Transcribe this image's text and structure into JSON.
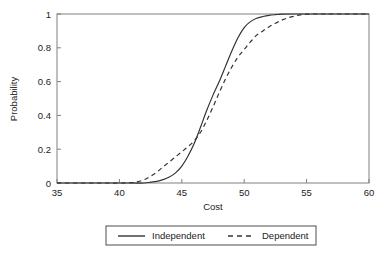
{
  "chart_data": {
    "type": "line",
    "title": "",
    "xlabel": "Cost",
    "ylabel": "Probability",
    "xlim": [
      35,
      60
    ],
    "ylim": [
      0,
      1
    ],
    "xticks": [
      35,
      40,
      45,
      50,
      55,
      60
    ],
    "xtick_labels": [
      "35",
      "40",
      "45",
      "50",
      "55",
      "60"
    ],
    "yticks": [
      0,
      0.2,
      0.4,
      0.6,
      0.8,
      1
    ],
    "ytick_labels": [
      "0",
      "0.2",
      "0.4",
      "0.6",
      "0.8",
      "1"
    ],
    "grid": false,
    "legend_position": "below",
    "frame": "box",
    "line_color": "#333333",
    "axis_color": "#808080",
    "series": [
      {
        "name": "Independent",
        "style": "solid",
        "x": [
          35,
          38,
          40,
          41,
          42,
          42.5,
          43,
          43.5,
          44,
          44.5,
          45,
          45.5,
          46,
          46.5,
          47,
          47.5,
          48,
          48.5,
          49,
          49.5,
          50,
          50.5,
          51,
          51.5,
          52,
          52.5,
          53,
          54,
          55,
          57,
          60
        ],
        "values": [
          0,
          0,
          0,
          0,
          0,
          0.005,
          0.01,
          0.02,
          0.035,
          0.06,
          0.1,
          0.16,
          0.235,
          0.33,
          0.43,
          0.52,
          0.6,
          0.69,
          0.78,
          0.86,
          0.92,
          0.955,
          0.975,
          0.985,
          0.992,
          0.996,
          0.999,
          1,
          1,
          1,
          1
        ]
      },
      {
        "name": "Dependent",
        "style": "dashed",
        "x": [
          35,
          38,
          40,
          41,
          41.5,
          42,
          42.5,
          43,
          43.5,
          44,
          44.5,
          45,
          45.5,
          46,
          46.5,
          47,
          47.5,
          48,
          48.5,
          49,
          49.5,
          50,
          50.5,
          51,
          51.5,
          52,
          52.5,
          53,
          53.5,
          54,
          54.5,
          55,
          55.5,
          57,
          60
        ],
        "values": [
          0,
          0,
          0,
          0.002,
          0.008,
          0.02,
          0.04,
          0.065,
          0.095,
          0.125,
          0.155,
          0.185,
          0.215,
          0.25,
          0.3,
          0.37,
          0.45,
          0.535,
          0.615,
          0.685,
          0.745,
          0.79,
          0.835,
          0.875,
          0.9,
          0.925,
          0.945,
          0.963,
          0.977,
          0.987,
          0.995,
          0.999,
          1,
          1,
          1
        ]
      }
    ]
  },
  "legend": {
    "entries": [
      {
        "label": "Independent",
        "style": "solid"
      },
      {
        "label": "Dependent",
        "style": "dashed"
      }
    ]
  }
}
